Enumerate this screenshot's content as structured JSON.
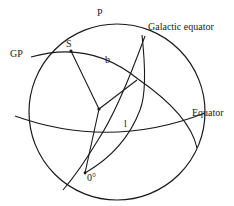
{
  "diagram": {
    "labels": {
      "pole": "P",
      "galactic_pole": "GP",
      "star": "S",
      "latitude": "b",
      "longitude": "l",
      "origin": "0°",
      "galactic_equator": "Galactic equator",
      "equator": "Equator"
    },
    "colors": {
      "line": "#1a1a1a",
      "background": "#ffffff"
    }
  }
}
